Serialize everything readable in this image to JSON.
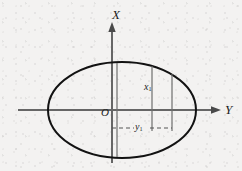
{
  "figure": {
    "caption_none": "",
    "background_color": "#f4f3f2",
    "ink_color": "#1c1c1c",
    "axis_color": "#595959",
    "construction_line_color": "#6b6b6b"
  },
  "axes": {
    "vertical": {
      "name": "X-axis",
      "label": "X",
      "arrow": "up",
      "x": 112,
      "y_top": 22,
      "y_bottom": 163
    },
    "horizontal": {
      "name": "Y-axis",
      "label": "Y",
      "arrow": "right",
      "y": 110,
      "x_left": 18,
      "x_right": 221
    },
    "origin": {
      "label": "O",
      "x": 112,
      "y": 110
    }
  },
  "ellipse": {
    "name": "ellipse-boundary",
    "center_x": 122,
    "center_y": 110,
    "radius_x": 74,
    "radius_y": 48,
    "stroke_width": 2
  },
  "construction_lines": {
    "vertical": [
      {
        "name": "vline-left",
        "x": 117,
        "y_top": 63,
        "y_bottom": 157
      },
      {
        "name": "vline-mid",
        "x": 152,
        "y_top": 66,
        "y_bottom": 131
      },
      {
        "name": "vline-right",
        "x": 172,
        "y_top": 74,
        "y_bottom": 131
      }
    ],
    "dashed": {
      "name": "y1-dashed-segment",
      "y": 128,
      "x_start": 112,
      "x_end": 172,
      "dash_pattern": "4 3"
    }
  },
  "labels": {
    "x_axis": "X",
    "y_axis": "Y",
    "origin": "O",
    "x1": {
      "base": "x",
      "sub": "1"
    },
    "y1": {
      "base": "y",
      "sub": "1"
    }
  }
}
